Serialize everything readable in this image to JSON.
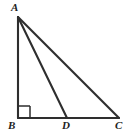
{
  "figure": {
    "kind": "geometry-diagram",
    "background_color": "#ffffff",
    "stroke_color": "#2e2e2e",
    "label_color": "#222222",
    "canvas": {
      "width": 135,
      "height": 138
    },
    "vertices": [
      {
        "id": "A",
        "label": "A",
        "x": 18,
        "y": 17,
        "label_x": 11,
        "label_y": 2
      },
      {
        "id": "B",
        "label": "B",
        "x": 18,
        "y": 118,
        "label_x": 8,
        "label_y": 120
      },
      {
        "id": "D",
        "label": "D",
        "x": 67,
        "y": 118,
        "label_x": 62,
        "label_y": 120
      },
      {
        "id": "C",
        "label": "C",
        "x": 119,
        "y": 118,
        "label_x": 115,
        "label_y": 120
      }
    ],
    "segments": [
      {
        "id": "AB",
        "from": "A",
        "to": "B",
        "x1": 18,
        "y1": 17,
        "x2": 18,
        "y2": 118
      },
      {
        "id": "BC",
        "from": "B",
        "to": "C",
        "x1": 18,
        "y1": 118,
        "x2": 119,
        "y2": 118
      },
      {
        "id": "AC",
        "from": "A",
        "to": "C",
        "x1": 18,
        "y1": 17,
        "x2": 119,
        "y2": 118
      },
      {
        "id": "AD",
        "from": "A",
        "to": "D",
        "x1": 18,
        "y1": 17,
        "x2": 67,
        "y2": 118
      }
    ],
    "right_angle": {
      "at": "B",
      "marker": "square",
      "size": 12,
      "path": "M 30 106 L 30 118 M 30 106 L 18 106"
    }
  }
}
